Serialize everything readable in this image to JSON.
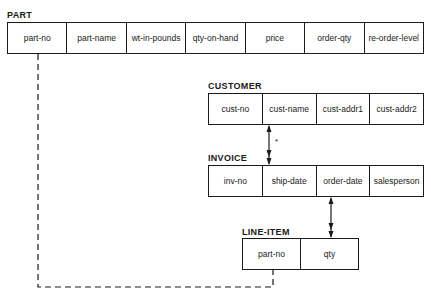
{
  "tables": {
    "part": {
      "name": "PART",
      "fields": [
        "part-no",
        "part-name",
        "wt-in-pounds",
        "qty-on-hand",
        "price",
        "order-qty",
        "re-order-level"
      ]
    },
    "customer": {
      "name": "CUSTOMER",
      "fields": [
        "cust-no",
        "cust-name",
        "cust-addr1",
        "cust-addr2"
      ]
    },
    "invoice": {
      "name": "INVOICE",
      "fields": [
        "inv-no",
        "ship-date",
        "order-date",
        "salesperson"
      ]
    },
    "line_item": {
      "name": "LINE-ITEM",
      "fields": [
        "part-no",
        "qty"
      ]
    }
  },
  "relationships": [
    {
      "from": "CUSTOMER.cust-name",
      "to": "INVOICE.ship-date",
      "style": "solid double-headed arrow",
      "annotation": "*"
    },
    {
      "from": "INVOICE.order-date",
      "to": "LINE-ITEM.qty",
      "style": "solid double-headed arrow"
    },
    {
      "from": "PART.part-no",
      "to": "LINE-ITEM.part-no",
      "style": "dashed line"
    }
  ],
  "annotations": {
    "star": "*"
  }
}
